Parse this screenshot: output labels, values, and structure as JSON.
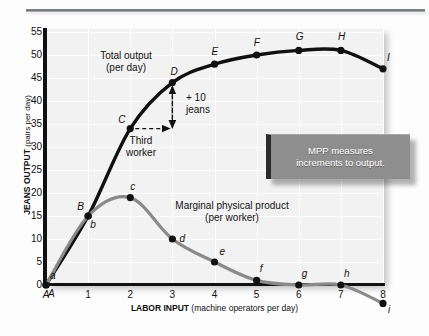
{
  "chart_data": {
    "type": "line",
    "title": "",
    "xlabel_bold": "LABOR INPUT",
    "xlabel_sub": "(machine operators per day)",
    "ylabel_bold": "JEANS OUTPUT",
    "ylabel_sub": "(pairs per day)",
    "xlim": [
      0,
      8
    ],
    "ylim": [
      -3,
      55
    ],
    "grid": true,
    "x": [
      0,
      1,
      2,
      3,
      4,
      5,
      6,
      7,
      8
    ],
    "xtick_labels": [
      "A",
      "1",
      "2",
      "3",
      "4",
      "5",
      "6",
      "7",
      "8"
    ],
    "ytick_labels": [
      "55",
      "50",
      "45",
      "40",
      "35",
      "30",
      "25",
      "20",
      "15",
      "10",
      "5",
      "0"
    ],
    "ytick_values": [
      55,
      50,
      45,
      40,
      35,
      30,
      25,
      20,
      15,
      10,
      5,
      0
    ],
    "series": [
      {
        "name": "Total output (per day)",
        "color": "#111111",
        "values": [
          0,
          15,
          34,
          44,
          48,
          50,
          51,
          51,
          47
        ],
        "point_labels": [
          "A",
          "B",
          "C",
          "D",
          "E",
          "F",
          "G",
          "H",
          "I"
        ]
      },
      {
        "name": "Marginal physical product (per worker)",
        "color": "#8a8a8a",
        "values": [
          0,
          15,
          19,
          10,
          5,
          1,
          0,
          0,
          -4
        ],
        "point_labels": [
          "a",
          "b",
          "c",
          "d",
          "e",
          "f",
          "g",
          "h",
          "i"
        ]
      }
    ],
    "annotations": [
      {
        "name": "total-output-label",
        "line1": "Total output",
        "line2": "(per day)"
      },
      {
        "name": "mpp-label",
        "line1": "Marginal physical product",
        "line2": "(per worker)"
      },
      {
        "name": "increment-label",
        "line1": "+ 10",
        "line2": "jeans"
      },
      {
        "name": "third-worker-label",
        "line1": "Third",
        "line2": "worker"
      }
    ]
  },
  "callout": {
    "line1": "MPP measures",
    "line2": "increments to output."
  }
}
